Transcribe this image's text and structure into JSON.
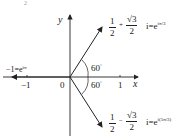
{
  "figure_label": "2",
  "axes": {
    "x_label": "x",
    "y_label": "y",
    "origin_label": "0",
    "tick_neg1": "−1",
    "tick_pos1": "1"
  },
  "angles": {
    "upper": "60",
    "lower": "60",
    "degree_symbol": "°"
  },
  "points": {
    "upper": {
      "frac1_num": "1",
      "frac1_den": "2",
      "op": "+",
      "frac2_num": "√3",
      "frac2_den": "2",
      "i": "i",
      "eq": "=e",
      "exp": "iπ/3"
    },
    "lower": {
      "frac1_num": "1",
      "frac1_den": "2",
      "op": "−",
      "frac2_num": "√3",
      "frac2_den": "2",
      "i": "i",
      "eq": "=e",
      "exp": "i(5π/3)"
    },
    "left": {
      "text": "−1=e",
      "exp": "iπ"
    }
  },
  "colors": {
    "ink": "#222222",
    "background": "#ffffff"
  }
}
